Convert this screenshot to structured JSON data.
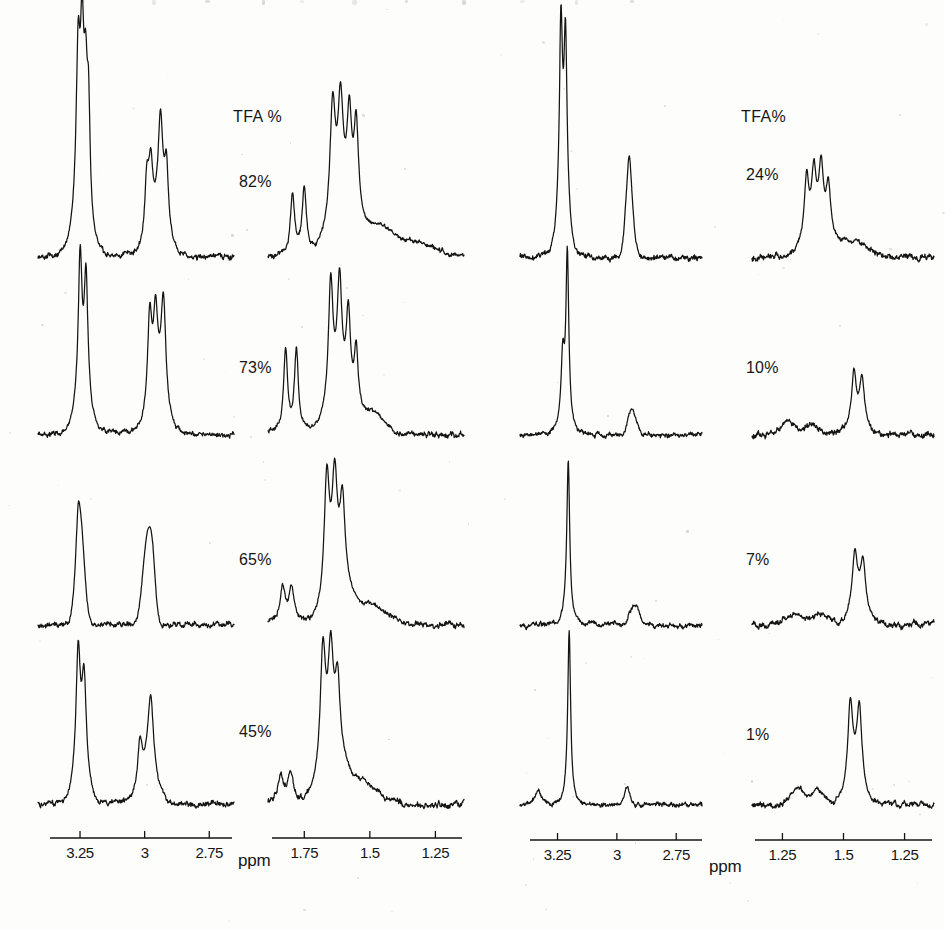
{
  "figure": {
    "kind": "nmr-spectra-grid",
    "rows": 4,
    "columns": 2,
    "line_color": "#141414",
    "background_color": "#fdfdfc"
  },
  "labels": {
    "tfa_header_left": "TFA %",
    "tfa_header_right": "TFA%",
    "ppm_left": "ppm",
    "ppm_right": "ppm"
  },
  "left_block": {
    "tfa_values": [
      "82%",
      "73%",
      "65%",
      "45%"
    ],
    "axis_downfield": {
      "ticks": [
        "3.25",
        "3",
        "2.75"
      ],
      "unit": "ppm",
      "range": [
        3.375,
        2.625
      ]
    },
    "axis_upfield": {
      "ticks": [
        "1.75",
        "1.5",
        "1.25"
      ],
      "unit": "ppm",
      "range": [
        1.875,
        1.125
      ]
    }
  },
  "right_block": {
    "tfa_values": [
      "24%",
      "10%",
      "7%",
      "1%"
    ],
    "axis_downfield": {
      "ticks": [
        "3.25",
        "3",
        "2.75"
      ],
      "unit": "ppm",
      "range": [
        3.375,
        2.625
      ]
    },
    "axis_upfield": {
      "ticks": [
        "1.25",
        "1.5",
        "1.25"
      ],
      "unit": "ppm",
      "range": [
        1.875,
        1.125
      ]
    }
  },
  "chart_data": {
    "type": "line",
    "title": "",
    "xlabel": "ppm",
    "ylabel": "",
    "grid": false,
    "legend": "none",
    "axis_direction": "decreasing-left-to-right",
    "panels": [
      {
        "id": "L1-downfield",
        "tfa": "82%",
        "block": "left",
        "region": "downfield",
        "xlim": [
          3.375,
          2.625
        ],
        "peaks": [
          {
            "ppm": 3.23,
            "rel_height": 1.0,
            "shape": "multiplet"
          },
          {
            "ppm": 3.21,
            "rel_height": 0.93,
            "shape": "multiplet"
          },
          {
            "ppm": 3.19,
            "rel_height": 0.78,
            "shape": "multiplet"
          },
          {
            "ppm": 2.95,
            "rel_height": 0.6,
            "shape": "multiplet"
          },
          {
            "ppm": 2.99,
            "rel_height": 0.4,
            "shape": "shoulder"
          }
        ]
      },
      {
        "id": "L1-upfield",
        "tfa": "82%",
        "block": "left",
        "region": "upfield",
        "xlim": [
          1.875,
          1.125
        ],
        "peaks": [
          {
            "ppm": 1.8,
            "rel_height": 0.45,
            "shape": "doublet"
          },
          {
            "ppm": 1.76,
            "rel_height": 0.46,
            "shape": "doublet"
          },
          {
            "ppm": 1.66,
            "rel_height": 0.9,
            "shape": "multiplet"
          },
          {
            "ppm": 1.6,
            "rel_height": 0.82,
            "shape": "multiplet"
          },
          {
            "ppm": 1.4,
            "rel_height": 0.3,
            "shape": "broad"
          }
        ]
      },
      {
        "id": "L2-downfield",
        "tfa": "73%",
        "block": "left",
        "region": "downfield",
        "xlim": [
          3.375,
          2.625
        ],
        "peaks": [
          {
            "ppm": 3.22,
            "rel_height": 0.95,
            "shape": "multiplet"
          },
          {
            "ppm": 3.2,
            "rel_height": 0.85,
            "shape": "multiplet"
          },
          {
            "ppm": 2.95,
            "rel_height": 0.72,
            "shape": "multiplet"
          }
        ]
      },
      {
        "id": "L2-upfield",
        "tfa": "73%",
        "block": "left",
        "region": "upfield",
        "xlim": [
          1.875,
          1.125
        ],
        "peaks": [
          {
            "ppm": 1.8,
            "rel_height": 0.62,
            "shape": "doublet"
          },
          {
            "ppm": 1.75,
            "rel_height": 0.62,
            "shape": "doublet"
          },
          {
            "ppm": 1.64,
            "rel_height": 0.95,
            "shape": "multiplet"
          },
          {
            "ppm": 1.58,
            "rel_height": 0.75,
            "shape": "multiplet"
          }
        ]
      },
      {
        "id": "L3-downfield",
        "tfa": "65%",
        "block": "left",
        "region": "downfield",
        "xlim": [
          3.375,
          2.625
        ],
        "peaks": [
          {
            "ppm": 3.22,
            "rel_height": 0.85,
            "shape": "broad"
          },
          {
            "ppm": 2.95,
            "rel_height": 0.8,
            "shape": "broad"
          }
        ]
      },
      {
        "id": "L3-upfield",
        "tfa": "65%",
        "block": "left",
        "region": "upfield",
        "xlim": [
          1.875,
          1.125
        ],
        "peaks": [
          {
            "ppm": 1.81,
            "rel_height": 0.3,
            "shape": "doublet"
          },
          {
            "ppm": 1.62,
            "rel_height": 0.95,
            "shape": "broad"
          },
          {
            "ppm": 1.55,
            "rel_height": 0.7,
            "shape": "shoulder"
          }
        ]
      },
      {
        "id": "L4-downfield",
        "tfa": "45%",
        "block": "left",
        "region": "downfield",
        "xlim": [
          3.375,
          2.625
        ],
        "peaks": [
          {
            "ppm": 3.22,
            "rel_height": 0.95,
            "shape": "multiplet"
          },
          {
            "ppm": 3.19,
            "rel_height": 0.72,
            "shape": "multiplet"
          },
          {
            "ppm": 2.93,
            "rel_height": 0.6,
            "shape": "broad"
          }
        ]
      },
      {
        "id": "L4-upfield",
        "tfa": "45%",
        "block": "left",
        "region": "upfield",
        "xlim": [
          1.875,
          1.125
        ],
        "peaks": [
          {
            "ppm": 1.8,
            "rel_height": 0.22,
            "shape": "noise"
          },
          {
            "ppm": 1.63,
            "rel_height": 0.95,
            "shape": "broad"
          },
          {
            "ppm": 1.57,
            "rel_height": 0.72,
            "shape": "shoulder"
          }
        ]
      },
      {
        "id": "R1-downfield",
        "tfa": "24%",
        "block": "right",
        "region": "downfield",
        "xlim": [
          3.375,
          2.625
        ],
        "peaks": [
          {
            "ppm": 3.16,
            "rel_height": 1.0,
            "shape": "multiplet"
          },
          {
            "ppm": 3.13,
            "rel_height": 0.9,
            "shape": "multiplet"
          },
          {
            "ppm": 2.9,
            "rel_height": 0.42,
            "shape": "broad"
          }
        ]
      },
      {
        "id": "R1-upfield",
        "tfa": "24%",
        "block": "right",
        "region": "upfield",
        "xlim": [
          1.875,
          1.125
        ],
        "peaks": [
          {
            "ppm": 1.66,
            "rel_height": 0.62,
            "shape": "multiplet"
          },
          {
            "ppm": 1.6,
            "rel_height": 0.58,
            "shape": "multiplet"
          },
          {
            "ppm": 1.52,
            "rel_height": 0.5,
            "shape": "multiplet"
          }
        ]
      },
      {
        "id": "R2-downfield",
        "tfa": "10%",
        "block": "right",
        "region": "downfield",
        "xlim": [
          3.375,
          2.625
        ],
        "peaks": [
          {
            "ppm": 3.1,
            "rel_height": 1.0,
            "shape": "singlet"
          },
          {
            "ppm": 3.13,
            "rel_height": 0.38,
            "shape": "shoulder"
          },
          {
            "ppm": 2.88,
            "rel_height": 0.18,
            "shape": "broad"
          }
        ]
      },
      {
        "id": "R2-upfield",
        "tfa": "10%",
        "block": "right",
        "region": "upfield",
        "xlim": [
          1.875,
          1.125
        ],
        "peaks": [
          {
            "ppm": 1.48,
            "rel_height": 0.55,
            "shape": "multiplet"
          },
          {
            "ppm": 1.44,
            "rel_height": 0.48,
            "shape": "multiplet"
          },
          {
            "ppm": 1.7,
            "rel_height": 0.2,
            "shape": "noise"
          }
        ]
      },
      {
        "id": "R3-downfield",
        "tfa": "7%",
        "block": "right",
        "region": "downfield",
        "xlim": [
          3.375,
          2.625
        ],
        "peaks": [
          {
            "ppm": 3.09,
            "rel_height": 1.0,
            "shape": "singlet"
          },
          {
            "ppm": 2.87,
            "rel_height": 0.15,
            "shape": "broad"
          }
        ]
      },
      {
        "id": "R3-upfield",
        "tfa": "7%",
        "block": "right",
        "region": "upfield",
        "xlim": [
          1.875,
          1.125
        ],
        "peaks": [
          {
            "ppm": 1.44,
            "rel_height": 0.62,
            "shape": "multiplet"
          },
          {
            "ppm": 1.4,
            "rel_height": 0.55,
            "shape": "multiplet"
          }
        ]
      },
      {
        "id": "R4-downfield",
        "tfa": "1%",
        "block": "right",
        "region": "downfield",
        "xlim": [
          3.375,
          2.625
        ],
        "peaks": [
          {
            "ppm": 3.08,
            "rel_height": 1.0,
            "shape": "singlet"
          },
          {
            "ppm": 2.84,
            "rel_height": 0.12,
            "shape": "small"
          }
        ]
      },
      {
        "id": "R4-upfield",
        "tfa": "1%",
        "block": "right",
        "region": "upfield",
        "xlim": [
          1.875,
          1.125
        ],
        "peaks": [
          {
            "ppm": 1.42,
            "rel_height": 0.85,
            "shape": "doublet"
          },
          {
            "ppm": 1.39,
            "rel_height": 0.82,
            "shape": "doublet"
          },
          {
            "ppm": 1.58,
            "rel_height": 0.25,
            "shape": "noise"
          }
        ]
      }
    ]
  }
}
